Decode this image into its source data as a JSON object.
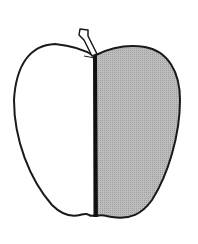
{
  "illustration": {
    "subject": "apple",
    "description": "Line drawing of an apple split vertically; left half white, right half shaded grey",
    "colors": {
      "background": "#ffffff",
      "outline": "#1a1a1a",
      "left_fill": "#ffffff",
      "right_fill": "#b4b4b4",
      "divider": "#111111"
    }
  }
}
